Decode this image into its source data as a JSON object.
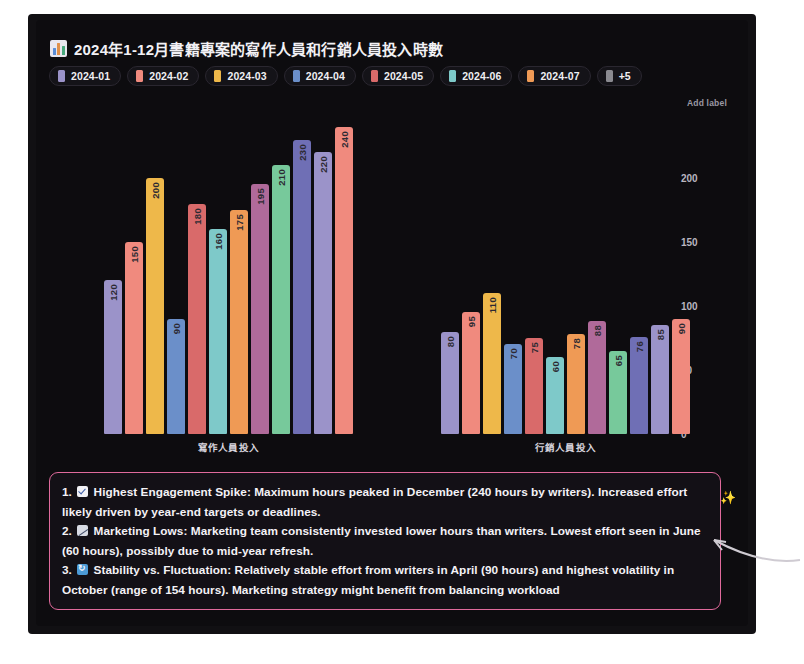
{
  "chart_title": "2024年1-12月書籍專案的寫作人員和行銷人員投入時數",
  "title_icon": "bar-chart-icon",
  "legend": {
    "items": [
      {
        "label": "2024-01",
        "color": "#9b93c9"
      },
      {
        "label": "2024-02",
        "color": "#f08a7e"
      },
      {
        "label": "2024-03",
        "color": "#eeb84a"
      },
      {
        "label": "2024-04",
        "color": "#6b8fc9"
      },
      {
        "label": "2024-05",
        "color": "#d96a6a"
      },
      {
        "label": "2024-06",
        "color": "#7ec9c9"
      },
      {
        "label": "2024-07",
        "color": "#ef9a55"
      },
      {
        "label": "+5",
        "color": "#8a8a90"
      }
    ]
  },
  "axis": {
    "y_add_label": "Add label",
    "y_ticks": [
      "200",
      "150",
      "100",
      "50",
      "0"
    ],
    "x_title": "月份"
  },
  "chart_data": {
    "type": "bar",
    "title": "2024年1-12月書籍專案的寫作人員和行銷人員投入時數",
    "xlabel": "月份",
    "ylabel": "Add label",
    "ylim": [
      0,
      250
    ],
    "yticks": [
      0,
      50,
      100,
      150,
      200
    ],
    "grid": false,
    "legend_position": "top-left",
    "categories": [
      "寫作人員投入",
      "行銷人員投入"
    ],
    "series": [
      {
        "name": "2024-01",
        "color": "#9b93c9",
        "values": [
          120,
          80
        ]
      },
      {
        "name": "2024-02",
        "color": "#f08a7e",
        "values": [
          150,
          95
        ]
      },
      {
        "name": "2024-03",
        "color": "#eeb84a",
        "values": [
          200,
          110
        ]
      },
      {
        "name": "2024-04",
        "color": "#6b8fc9",
        "values": [
          90,
          70
        ]
      },
      {
        "name": "2024-05",
        "color": "#d96a6a",
        "values": [
          180,
          75
        ]
      },
      {
        "name": "2024-06",
        "color": "#7ec9c9",
        "values": [
          160,
          60
        ]
      },
      {
        "name": "2024-07",
        "color": "#ef9a55",
        "values": [
          175,
          78
        ]
      },
      {
        "name": "2024-08",
        "color": "#b06a9a",
        "values": [
          195,
          88
        ]
      },
      {
        "name": "2024-09",
        "color": "#77c99b",
        "values": [
          210,
          65
        ]
      },
      {
        "name": "2024-10",
        "color": "#6f6fb5",
        "values": [
          230,
          76
        ]
      },
      {
        "name": "2024-11",
        "color": "#9b93c9",
        "values": [
          220,
          85
        ]
      },
      {
        "name": "2024-12",
        "color": "#f08a7e",
        "values": [
          240,
          90
        ]
      }
    ]
  },
  "groups": [
    {
      "label": "寫作人員投入",
      "bars": [
        {
          "value": 120,
          "color": "#9b93c9"
        },
        {
          "value": 150,
          "color": "#f08a7e"
        },
        {
          "value": 200,
          "color": "#eeb84a"
        },
        {
          "value": 90,
          "color": "#6b8fc9"
        },
        {
          "value": 180,
          "color": "#d96a6a"
        },
        {
          "value": 160,
          "color": "#7ec9c9"
        },
        {
          "value": 175,
          "color": "#ef9a55"
        },
        {
          "value": 195,
          "color": "#b06a9a"
        },
        {
          "value": 210,
          "color": "#77c99b"
        },
        {
          "value": 230,
          "color": "#6f6fb5"
        },
        {
          "value": 220,
          "color": "#9b93c9"
        },
        {
          "value": 240,
          "color": "#f08a7e"
        }
      ]
    },
    {
      "label": "行銷人員投入",
      "bars": [
        {
          "value": 80,
          "color": "#9b93c9"
        },
        {
          "value": 95,
          "color": "#f08a7e"
        },
        {
          "value": 110,
          "color": "#eeb84a"
        },
        {
          "value": 70,
          "color": "#6b8fc9"
        },
        {
          "value": 75,
          "color": "#d96a6a"
        },
        {
          "value": 60,
          "color": "#7ec9c9"
        },
        {
          "value": 78,
          "color": "#ef9a55"
        },
        {
          "value": 88,
          "color": "#b06a9a"
        },
        {
          "value": 65,
          "color": "#77c99b"
        },
        {
          "value": 76,
          "color": "#6f6fb5"
        },
        {
          "value": 85,
          "color": "#9b93c9"
        },
        {
          "value": 90,
          "color": "#f08a7e"
        }
      ]
    }
  ],
  "insights": {
    "border_color": "#e06a9c",
    "items": [
      {
        "number": "1.",
        "emoji": "check-box-icon",
        "emoji_class": "e-check",
        "text": "Highest Engagement Spike: Maximum hours peaked in December (240 hours by writers). Increased effort likely driven by year-end targets or deadlines."
      },
      {
        "number": "2.",
        "emoji": "chart-decreasing-icon",
        "emoji_class": "e-chart",
        "text": "Marketing Lows: Marketing team consistently invested lower hours than writers. Lowest effort seen in June (60 hours), possibly due to mid-year refresh."
      },
      {
        "number": "3.",
        "emoji": "recycle-icon",
        "emoji_class": "e-cycle",
        "text": "Stability vs. Fluctuation: Relatively stable effort from writers in April (90 hours) and highest volatility in October (range of 154 hours). Marketing strategy might benefit from balancing workload"
      }
    ]
  },
  "sparkle_icon": "✨"
}
